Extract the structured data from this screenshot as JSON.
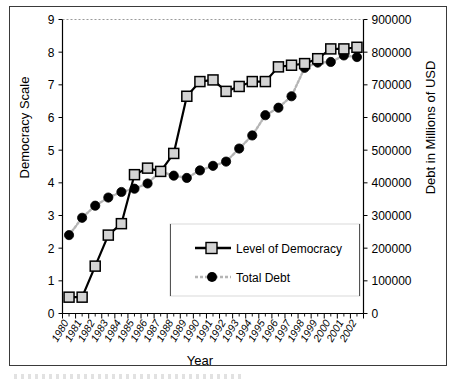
{
  "chart_data": {
    "type": "line",
    "title": "",
    "xlabel": "Year",
    "ylabel": "Democracy Scale",
    "y2label": "Debt in Millions of USD",
    "grid": false,
    "legend_position": "center",
    "x": [
      1980,
      1981,
      1982,
      1983,
      1984,
      1985,
      1986,
      1987,
      1988,
      1989,
      1990,
      1991,
      1992,
      1993,
      1994,
      1995,
      1996,
      1997,
      1998,
      1999,
      2000,
      2001,
      2002
    ],
    "categories": [
      "1980",
      "1981",
      "1982",
      "1983",
      "1984",
      "1985",
      "1986",
      "1987",
      "1988",
      "1989",
      "1990",
      "1991",
      "1992",
      "1993",
      "1994",
      "1995",
      "1996",
      "1997",
      "1998",
      "1999",
      "2000",
      "2001",
      "2002"
    ],
    "ylim": [
      0,
      9
    ],
    "yticks": [
      0,
      1,
      2,
      3,
      4,
      5,
      6,
      7,
      8,
      9
    ],
    "ytick_labels": [
      "0",
      "1",
      "2",
      "3",
      "4",
      "5",
      "6",
      "7",
      "8",
      "9"
    ],
    "y2lim": [
      0,
      900000
    ],
    "y2ticks": [
      0,
      100000,
      200000,
      300000,
      400000,
      500000,
      600000,
      700000,
      800000,
      900000
    ],
    "y2tick_labels": [
      "0",
      "100000",
      "200000",
      "300000",
      "400000",
      "500000",
      "600000",
      "700000",
      "800000",
      "900000"
    ],
    "series": [
      {
        "name": "Level of Democracy",
        "axis": "left",
        "marker": "square",
        "color": "#000000",
        "marker_fill": "#d4d4d4",
        "line_style": "solid",
        "values": [
          0.5,
          0.5,
          1.45,
          2.4,
          2.75,
          4.25,
          4.45,
          4.35,
          4.9,
          6.65,
          7.1,
          7.15,
          6.8,
          6.95,
          7.1,
          7.1,
          7.55,
          7.6,
          7.65,
          7.8,
          8.1,
          8.1,
          8.15
        ]
      },
      {
        "name": "Total Debt",
        "axis": "right",
        "marker": "circle",
        "color": "#000000",
        "line_color": "#b5b5b5",
        "marker_fill": "#000000",
        "line_style": "dotted",
        "values": [
          240000,
          293000,
          330000,
          355000,
          372000,
          382000,
          398000,
          435000,
          422000,
          415000,
          438000,
          452000,
          465000,
          505000,
          545000,
          607000,
          630000,
          665000,
          752000,
          768000,
          770000,
          790000,
          785000
        ]
      }
    ]
  },
  "axes": {
    "x_title": "Year",
    "y_left_title": "Democracy Scale",
    "y_right_title": "Debt in Millions of USD"
  },
  "legend": {
    "items": [
      {
        "label": "Level of Democracy"
      },
      {
        "label": "Total Debt"
      }
    ]
  }
}
